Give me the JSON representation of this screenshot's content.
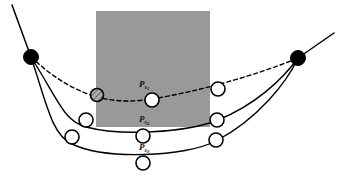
{
  "figure": {
    "background_color": "#ffffff",
    "width": 344,
    "height": 178
  },
  "occluder": {
    "name": "gray-occlusion-rectangle",
    "fill_color": "#999999",
    "x": 96,
    "y": 11,
    "width": 114,
    "height": 116
  },
  "endpoints": [
    {
      "name": "left-endpoint",
      "label": "",
      "x": 31,
      "y": 57,
      "radius": 7.5,
      "fill_color": "#000000",
      "stroke_color": "#000000"
    },
    {
      "name": "right-endpoint",
      "label": "",
      "x": 298,
      "y": 58,
      "radius": 7.5,
      "fill_color": "#000000",
      "stroke_color": "#000000"
    }
  ],
  "tails": [
    {
      "name": "left-tail-line",
      "x1": 12,
      "y1": 5,
      "x2": 31,
      "y2": 57
    },
    {
      "name": "right-tail-line",
      "x1": 298,
      "y1": 58,
      "x2": 334,
      "y2": 33
    }
  ],
  "curves": [
    {
      "name": "curve-s1",
      "label": "P",
      "subscript": "s",
      "subsubscript": "1",
      "label_x": 139,
      "label_y": 80,
      "style": "dashed",
      "stroke_color": "#000000",
      "stroke_width": 1.4,
      "dash_pattern": "4,3",
      "path": "M31,57 C 80,103 120,104 152,99 C 195,92 255,76 298,58",
      "control_points": [
        {
          "name": "control-point-s1-left",
          "x": 97,
          "y": 95,
          "radius": 6.5,
          "hatched": true
        },
        {
          "name": "control-point-s1-mid",
          "x": 152,
          "y": 100,
          "radius": 7.0,
          "hatched": false
        },
        {
          "name": "control-point-s1-right",
          "x": 218,
          "y": 89,
          "radius": 7.0,
          "hatched": false
        }
      ]
    },
    {
      "name": "curve-s2",
      "label": "P",
      "subscript": "s",
      "subsubscript": "2",
      "label_x": 139,
      "label_y": 115,
      "style": "solid",
      "stroke_color": "#000000",
      "stroke_width": 1.4,
      "dash_pattern": "",
      "path": "M31,57 C 60,103 64,121 86,127 C 120,136 185,133 218,120 C 255,105 282,80 298,58",
      "control_points": [
        {
          "name": "control-point-s2-left",
          "x": 86,
          "y": 120,
          "radius": 7.0,
          "hatched": false
        },
        {
          "name": "control-point-s2-mid",
          "x": 143,
          "y": 136,
          "radius": 7.0,
          "hatched": false
        },
        {
          "name": "control-point-s2-right",
          "x": 217,
          "y": 120,
          "radius": 7.0,
          "hatched": false
        }
      ]
    },
    {
      "name": "curve-s3",
      "label": "P",
      "subscript": "s",
      "subsubscript": "3",
      "label_x": 139,
      "label_y": 143,
      "style": "solid",
      "stroke_color": "#000000",
      "stroke_width": 1.4,
      "dash_pattern": "",
      "path": "M31,57 C 47,105 52,135 72,144 C 105,160 185,157 216,141 C 258,119 287,82 298,58",
      "control_points": [
        {
          "name": "control-point-s3-left",
          "x": 72,
          "y": 137,
          "radius": 7.0,
          "hatched": false
        },
        {
          "name": "control-point-s3-mid",
          "x": 143,
          "y": 163,
          "radius": 7.0,
          "hatched": false
        },
        {
          "name": "control-point-s3-right",
          "x": 216,
          "y": 140,
          "radius": 7.0,
          "hatched": false
        }
      ]
    }
  ],
  "marker_style": {
    "open_circle_fill": "#ffffff",
    "open_circle_stroke": "#000000",
    "open_circle_stroke_width": 1.6,
    "hatched_circle_fill": "#b4b4b4"
  }
}
